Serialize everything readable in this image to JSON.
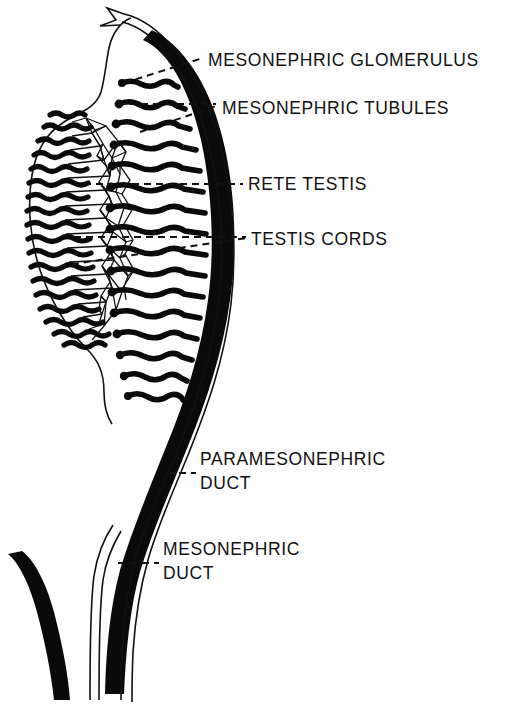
{
  "figure": {
    "type": "anatomical-diagram",
    "background_color": "#fefefe",
    "ink_color": "#111111"
  },
  "labels": [
    {
      "id": "mesonephric-glomerulus",
      "text": "MESONEPHRIC  GLOMERULUS",
      "x": 208,
      "y": 66,
      "leader_from": [
        124,
        83
      ],
      "leader_to": [
        203,
        58
      ]
    },
    {
      "id": "mesonephric-tubules",
      "text": "MESONEPHRIC  TUBULES",
      "x": 222,
      "y": 114,
      "leader_from": [
        140,
        130
      ],
      "leader_to": [
        217,
        106
      ]
    },
    {
      "id": "rete-testis",
      "text": "RETE TESTIS",
      "x": 248,
      "y": 190,
      "leader_from": [
        86,
        184
      ],
      "leader_to": [
        243,
        184
      ]
    },
    {
      "id": "testis-cords",
      "text": "TESTIS CORDS",
      "x": 251,
      "y": 245,
      "leader_from": [
        62,
        265
      ],
      "leader_to": [
        246,
        238
      ]
    },
    {
      "id": "paramesonephric-duct-line1",
      "text": "PARAMESONEPHRIC",
      "x": 200,
      "y": 465,
      "leader_from": [
        168,
        472
      ],
      "leader_to": [
        196,
        472
      ]
    },
    {
      "id": "paramesonephric-duct-line2",
      "text": "DUCT",
      "x": 200,
      "y": 489
    },
    {
      "id": "mesonephric-duct-line1",
      "text": "MESONEPHRIC",
      "x": 163,
      "y": 555,
      "leader_from": [
        120,
        562
      ],
      "leader_to": [
        159,
        562
      ]
    },
    {
      "id": "mesonephric-duct-line2",
      "text": "DUCT",
      "x": 163,
      "y": 579
    }
  ],
  "structures": {
    "gonad_outline": "oval testis body left of the mesonephric duct",
    "testis_cords_count": 18,
    "mesonephric_tubules_count": 15,
    "rete_testis": "polygonal anastomosing network between cords and tubules",
    "arrow_label": "open arrow at cranial end of paramesonephric duct",
    "mesonephric_duct": "thick solid black duct curving along right border",
    "paramesonephric_duct": "thin paired outline duct lateral to mesonephric duct",
    "lower_branch": "thick black duct branching to lower left"
  }
}
